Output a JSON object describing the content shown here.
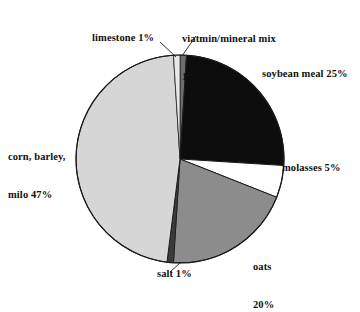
{
  "chart_data": {
    "type": "pie",
    "title": "",
    "subtitle": "",
    "xlabel": "",
    "ylabel": "",
    "legend_position": "none",
    "grid": false,
    "labels_outside": true,
    "units": "percent",
    "total": 100,
    "start_angle_deg": 0,
    "direction": "clockwise",
    "categories": [
      "viatmin/mineral mix",
      "soybean meal",
      "molasses",
      "oats",
      "salt",
      "corn, barley, milo",
      "limestone"
    ],
    "values": [
      1,
      25,
      5,
      20,
      1,
      47,
      1
    ],
    "slices": [
      {
        "name": "viatmin/mineral mix",
        "value": 1,
        "value_text": "1%",
        "label_lines": [
          "viatmin/mineral mix",
          "1%"
        ],
        "color": "#6d6d6d",
        "start_deg": 0,
        "end_deg": 3.6,
        "has_leader_line": true
      },
      {
        "name": "soybean meal",
        "value": 25,
        "value_text": "25%",
        "label_lines": [
          "soybean meal 25%"
        ],
        "color": "#0d0d0d",
        "start_deg": 3.6,
        "end_deg": 93.6,
        "has_leader_line": false
      },
      {
        "name": "molasses",
        "value": 5,
        "value_text": "5%",
        "label_lines": [
          "molasses 5%"
        ],
        "color": "#ffffff",
        "start_deg": 93.6,
        "end_deg": 111.6,
        "has_leader_line": false
      },
      {
        "name": "oats",
        "value": 20,
        "value_text": "20%",
        "label_lines": [
          "oats",
          "20%"
        ],
        "color": "#8c8c8c",
        "start_deg": 111.6,
        "end_deg": 183.6,
        "has_leader_line": false
      },
      {
        "name": "salt",
        "value": 1,
        "value_text": "1%",
        "label_lines": [
          "salt 1%"
        ],
        "color": "#3a3a3a",
        "start_deg": 183.6,
        "end_deg": 187.2,
        "has_leader_line": true
      },
      {
        "name": "corn, barley, milo",
        "value": 47,
        "value_text": "47%",
        "label_lines": [
          "corn, barley,",
          "milo 47%"
        ],
        "color": "#d6d6d6",
        "start_deg": 187.2,
        "end_deg": 356.4,
        "has_leader_line": false
      },
      {
        "name": "limestone",
        "value": 1,
        "value_text": "1%",
        "label_lines": [
          "limestone 1%"
        ],
        "color": "#e9e9e9",
        "start_deg": 356.4,
        "end_deg": 360,
        "has_leader_line": true
      }
    ]
  },
  "labels": {
    "vitamin_line1": "viatmin/mineral mix",
    "vitamin_line2": "1%",
    "limestone": "limestone 1%",
    "soybean": "soybean meal 25%",
    "molasses": "molasses 5%",
    "oats_line1": "oats",
    "oats_line2": "20%",
    "salt": "salt 1%",
    "corn_line1": "corn, barley,",
    "corn_line2": "milo 47%"
  },
  "colors": {
    "soybean_meal": "#0d0d0d",
    "molasses": "#ffffff",
    "oats": "#8c8c8c",
    "corn_barley_milo": "#d6d6d6",
    "limestone": "#e9e9e9",
    "vitamin_mineral_mix": "#6d6d6d",
    "salt": "#3a3a3a",
    "outline": "#1a1a1a",
    "background": "#ffffff",
    "text": "#111111"
  }
}
